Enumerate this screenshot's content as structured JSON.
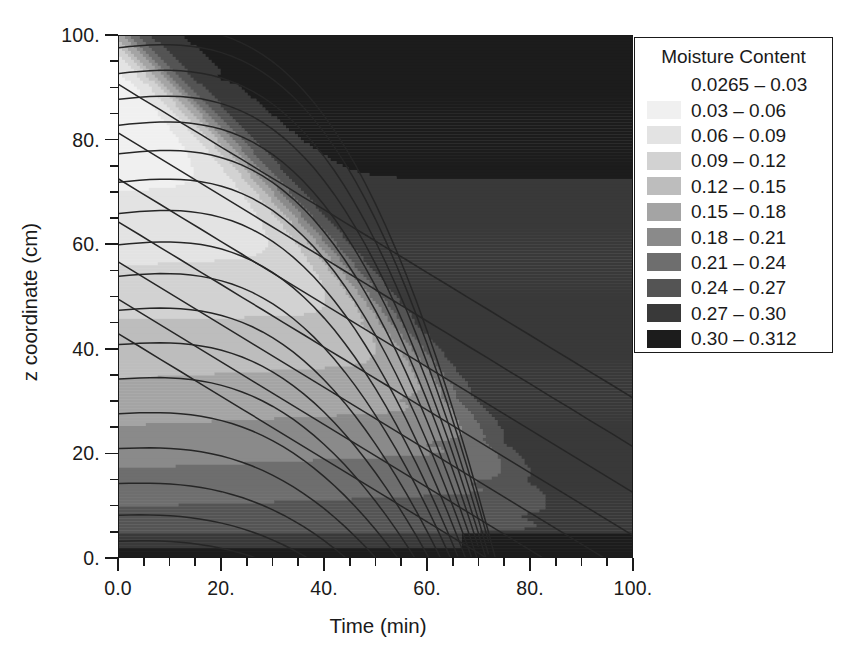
{
  "figure": {
    "background": "#ffffff",
    "foreground": "#1a1a1a"
  },
  "axes": {
    "x": {
      "title": "Time (min)",
      "min": 0,
      "max": 100,
      "major_ticks": [
        0,
        20,
        40,
        60,
        80,
        100
      ],
      "major_labels": [
        "0.0",
        "20.",
        "40.",
        "60.",
        "80.",
        "100."
      ],
      "minor_step": 5
    },
    "y": {
      "title": "z coordinate (cm)",
      "min": 0,
      "max": 100,
      "major_ticks": [
        0,
        20,
        40,
        60,
        80,
        100
      ],
      "major_labels": [
        "0.",
        "20.",
        "40.",
        "60.",
        "80.",
        "100."
      ],
      "minor_step": 5
    }
  },
  "legend": {
    "title": "Moisture Content",
    "entries": [
      {
        "label": "0.0265 – 0.03",
        "color": "#ffffff",
        "low": 0.0265,
        "high": 0.03
      },
      {
        "label": "0.03 – 0.06",
        "color": "#f0f0f0",
        "low": 0.03,
        "high": 0.06
      },
      {
        "label": "0.06 – 0.09",
        "color": "#e3e3e3",
        "low": 0.06,
        "high": 0.09
      },
      {
        "label": "0.09 – 0.12",
        "color": "#d2d2d2",
        "low": 0.09,
        "high": 0.12
      },
      {
        "label": "0.12 – 0.15",
        "color": "#bdbdbd",
        "low": 0.12,
        "high": 0.15
      },
      {
        "label": "0.15 – 0.18",
        "color": "#a4a4a4",
        "low": 0.15,
        "high": 0.18
      },
      {
        "label": "0.18 – 0.21",
        "color": "#8a8a8a",
        "low": 0.18,
        "high": 0.21
      },
      {
        "label": "0.21 – 0.24",
        "color": "#6e6e6e",
        "low": 0.21,
        "high": 0.24
      },
      {
        "label": "0.24 – 0.27",
        "color": "#545454",
        "low": 0.24,
        "high": 0.27
      },
      {
        "label": "0.27 – 0.30",
        "color": "#393939",
        "low": 0.27,
        "high": 0.3
      },
      {
        "label": "0.30 – 0.312",
        "color": "#1c1c1c",
        "low": 0.3,
        "high": 0.312
      }
    ]
  },
  "chart_data": {
    "type": "heatmap",
    "title": "",
    "xlabel": "Time (min)",
    "ylabel": "z coordinate (cm)",
    "xlim": [
      0,
      100
    ],
    "ylim": [
      0,
      100
    ],
    "grid": false,
    "legend_position": "right-outside",
    "colorbar_label": "Moisture Content",
    "value_range": [
      0.0265,
      0.312
    ],
    "x": [
      0,
      10,
      20,
      30,
      40,
      50,
      60,
      70,
      80,
      90,
      100
    ],
    "y": [
      100,
      90,
      80,
      70,
      60,
      50,
      40,
      30,
      20,
      10,
      0
    ],
    "z_moisture": [
      [
        0.29,
        0.3,
        0.305,
        0.306,
        0.306,
        0.306,
        0.306,
        0.306,
        0.306,
        0.306,
        0.306
      ],
      [
        0.06,
        0.12,
        0.23,
        0.27,
        0.29,
        0.3,
        0.303,
        0.305,
        0.306,
        0.306,
        0.306
      ],
      [
        0.04,
        0.05,
        0.075,
        0.16,
        0.23,
        0.265,
        0.285,
        0.295,
        0.3,
        0.303,
        0.305
      ],
      [
        0.045,
        0.052,
        0.062,
        0.085,
        0.15,
        0.215,
        0.255,
        0.28,
        0.292,
        0.298,
        0.302
      ],
      [
        0.05,
        0.057,
        0.066,
        0.08,
        0.1,
        0.16,
        0.22,
        0.258,
        0.28,
        0.292,
        0.298
      ],
      [
        0.06,
        0.066,
        0.075,
        0.086,
        0.1,
        0.118,
        0.17,
        0.225,
        0.262,
        0.282,
        0.293
      ],
      [
        0.08,
        0.086,
        0.094,
        0.104,
        0.115,
        0.128,
        0.148,
        0.195,
        0.24,
        0.268,
        0.285
      ],
      [
        0.12,
        0.126,
        0.133,
        0.141,
        0.15,
        0.16,
        0.172,
        0.192,
        0.228,
        0.258,
        0.278
      ],
      [
        0.165,
        0.17,
        0.176,
        0.182,
        0.189,
        0.196,
        0.205,
        0.216,
        0.232,
        0.255,
        0.274
      ],
      [
        0.215,
        0.219,
        0.223,
        0.228,
        0.233,
        0.238,
        0.244,
        0.251,
        0.26,
        0.271,
        0.284
      ],
      [
        0.29,
        0.292,
        0.293,
        0.294,
        0.295,
        0.296,
        0.297,
        0.298,
        0.3,
        0.302,
        0.305
      ]
    ],
    "contour_lines_note": "Approximately 17 black curves fan out from the left (t=0) edge; each rises gently toward mid-domain then sweeps steeply down to the right edge, with the upper curves crossing a set of near-straight diagonals in the dark upper-right wet zone."
  }
}
